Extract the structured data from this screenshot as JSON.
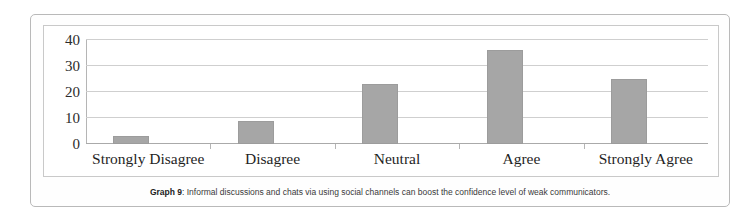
{
  "caption": {
    "label": "Graph 9",
    "separator": ": ",
    "text": "Informal discussions and chats via using social channels can boost the confidence level of weak communicators."
  },
  "colors": {
    "bar_fill": "#a6a6a6",
    "bar_stroke": "#9c9c9c",
    "gridline": "#cfcfcf",
    "axis": "#b5b5b5",
    "frame": "#b9b9b9",
    "text": "#1f1f1f"
  },
  "chart_data": {
    "type": "bar",
    "title": "",
    "xlabel": "",
    "ylabel": "",
    "categories": [
      "Strongly Disagree",
      "Disagree",
      "Neutral",
      "Agree",
      "Strongly Agree"
    ],
    "values": [
      3,
      9,
      23,
      36,
      25
    ],
    "ylim": [
      0,
      40
    ],
    "yticks": [
      0,
      10,
      20,
      30,
      40
    ],
    "ytick_labels": [
      "0",
      "10",
      "20",
      "30",
      "40"
    ],
    "grid": true,
    "legend": false,
    "series": [
      {
        "name": "Responses",
        "values": [
          3,
          9,
          23,
          36,
          25
        ]
      }
    ]
  }
}
